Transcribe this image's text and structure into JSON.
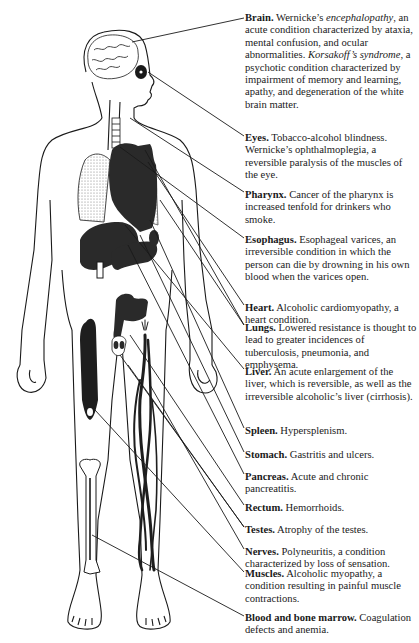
{
  "figure": {
    "colors": {
      "ink": "#1a1a1a",
      "organ_fill": "#2a2a2a",
      "lung_stipple": "#9a9a9a",
      "background": "#ffffff"
    }
  },
  "labels": [
    {
      "id": "brain",
      "title": "Brain.",
      "parts": [
        {
          "t": " Wernicke’s ",
          "s": "n"
        },
        {
          "t": "encephalopathy",
          "s": "i"
        },
        {
          "t": ", an acute condition characterized by ataxia, mental confusion, and ocular abnormalities. ",
          "s": "n"
        },
        {
          "t": "Korsakoff’s syndrome",
          "s": "i"
        },
        {
          "t": ", a psychotic condition characterized by impairment of memory and learning, apathy, and degeneration of the white brain matter.",
          "s": "n"
        }
      ],
      "top": 12
    },
    {
      "id": "eyes",
      "title": "Eyes.",
      "parts": [
        {
          "t": " Tobacco-alcohol blindness. Wernicke’s ophthalmoplegia, a reversible paralysis of the muscles of the eye.",
          "s": "n"
        }
      ],
      "top": 132
    },
    {
      "id": "pharynx",
      "title": "Pharynx.",
      "parts": [
        {
          "t": " Cancer of the pharynx is increased tenfold for drinkers who smoke.",
          "s": "n"
        }
      ],
      "top": 189
    },
    {
      "id": "esophagus",
      "title": "Esophagus.",
      "parts": [
        {
          "t": " Esophageal varices, an irreversible condition in which the person can die by drowning in his own blood when the varices open.",
          "s": "n"
        }
      ],
      "top": 234
    },
    {
      "id": "heart",
      "title": "Heart.",
      "parts": [
        {
          "t": " Alcoholic cardiomyopathy, a heart condition.",
          "s": "n"
        }
      ],
      "top": 302
    },
    {
      "id": "lungs",
      "title": "Lungs.",
      "parts": [
        {
          "t": " Lowered resistance is thought to lead to greater incidences of tuberculosis, pneumonia, and emphysema.",
          "s": "n"
        }
      ],
      "top": 322
    },
    {
      "id": "liver",
      "title": "Liver.",
      "parts": [
        {
          "t": " An acute enlargement of the liver, which is reversible, as well as the irreversible alcoholic’s liver (cirrhosis).",
          "s": "n"
        }
      ],
      "top": 366
    },
    {
      "id": "spleen",
      "title": "Spleen.",
      "parts": [
        {
          "t": " Hypersplenism.",
          "s": "n"
        }
      ],
      "top": 425
    },
    {
      "id": "stomach",
      "title": "Stomach.",
      "parts": [
        {
          "t": " Gastritis and ulcers.",
          "s": "n"
        }
      ],
      "top": 449
    },
    {
      "id": "pancreas",
      "title": "Pancreas.",
      "parts": [
        {
          "t": " Acute and chronic pancreatitis.",
          "s": "n"
        }
      ],
      "top": 471
    },
    {
      "id": "rectum",
      "title": "Rectum.",
      "parts": [
        {
          "t": " Hemorrhoids.",
          "s": "n"
        }
      ],
      "top": 502
    },
    {
      "id": "testes",
      "title": "Testes.",
      "parts": [
        {
          "t": " Atrophy of the testes.",
          "s": "n"
        }
      ],
      "top": 524
    },
    {
      "id": "nerves",
      "title": "Nerves.",
      "parts": [
        {
          "t": " Polyneuritis, a condition characterized by loss of sensation.",
          "s": "n"
        }
      ],
      "top": 546
    },
    {
      "id": "muscles",
      "title": "Muscles.",
      "parts": [
        {
          "t": " Alcoholic myopathy, a condition resulting in painful muscle contractions.",
          "s": "n"
        }
      ],
      "top": 568
    },
    {
      "id": "blood",
      "title": "Blood and bone marrow.",
      "parts": [
        {
          "t": " Coagulation defects and anemia.",
          "s": "n"
        }
      ],
      "top": 612
    }
  ],
  "leader_lines": [
    {
      "to": "brain",
      "from": [
        132,
        42
      ],
      "end": [
        244,
        18
      ]
    },
    {
      "to": "eyes",
      "from": [
        148,
        72
      ],
      "end": [
        244,
        136
      ]
    },
    {
      "to": "pharynx",
      "from": [
        130,
        118
      ],
      "end": [
        244,
        192
      ]
    },
    {
      "to": "esophagus",
      "from": [
        120,
        147
      ],
      "end": [
        244,
        238
      ]
    },
    {
      "to": "heart",
      "from": [
        148,
        162
      ],
      "end": [
        244,
        305
      ]
    },
    {
      "to": "lungs",
      "from": [
        145,
        150
      ],
      "end": [
        244,
        325
      ]
    },
    {
      "to": "lungs",
      "from": [
        160,
        200
      ],
      "end": [
        244,
        325
      ]
    },
    {
      "to": "liver",
      "from": [
        125,
        225
      ],
      "end": [
        244,
        369
      ]
    },
    {
      "to": "spleen",
      "from": [
        150,
        220
      ],
      "end": [
        244,
        428
      ]
    },
    {
      "to": "stomach",
      "from": [
        140,
        235
      ],
      "end": [
        244,
        452
      ]
    },
    {
      "to": "pancreas",
      "from": [
        128,
        245
      ],
      "end": [
        244,
        474
      ]
    },
    {
      "to": "rectum",
      "from": [
        130,
        335
      ],
      "end": [
        244,
        505
      ]
    },
    {
      "to": "testes",
      "from": [
        120,
        355
      ],
      "end": [
        244,
        527
      ]
    },
    {
      "to": "testes",
      "from": [
        128,
        365
      ],
      "end": [
        244,
        527
      ]
    },
    {
      "to": "nerves",
      "from": [
        150,
        385
      ],
      "end": [
        244,
        549
      ]
    },
    {
      "to": "muscles",
      "from": [
        95,
        410
      ],
      "end": [
        244,
        572
      ]
    },
    {
      "to": "blood",
      "from": [
        92,
        535
      ],
      "end": [
        244,
        616
      ]
    }
  ]
}
